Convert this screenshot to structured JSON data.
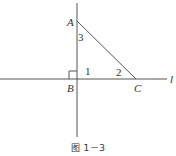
{
  "figure": {
    "caption": "图 1－3",
    "stroke_color": "#555555",
    "points": {
      "A": {
        "label": "A",
        "x": 77,
        "y": 21
      },
      "B": {
        "label": "B",
        "x": 77,
        "y": 79
      },
      "C": {
        "label": "C",
        "x": 136,
        "y": 79
      }
    },
    "line_label": "l",
    "angles": {
      "angle1": "1",
      "angle2": "2",
      "angle3": "3"
    },
    "right_angle_marker": true
  }
}
